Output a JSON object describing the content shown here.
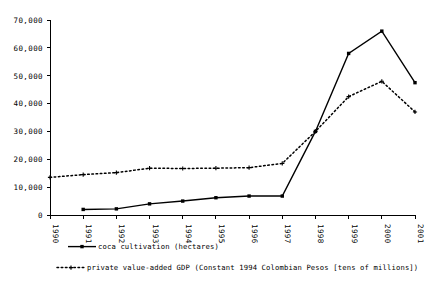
{
  "chart_data": {
    "type": "line",
    "title": "",
    "subtitle": "",
    "xlabel": "",
    "ylabel": "",
    "xlim": [
      1990,
      2001
    ],
    "ylim": [
      0,
      70000
    ],
    "grid": false,
    "legend_position": "bottom-left",
    "categories": [
      1990,
      1991,
      1992,
      1993,
      1994,
      1995,
      1996,
      1997,
      1998,
      1999,
      2000,
      2001
    ],
    "x_tick_labels": [
      "1990",
      "1991",
      "1992",
      "1993",
      "1994",
      "1995",
      "1996",
      "1997",
      "1998",
      "1999",
      "2000",
      "2001"
    ],
    "y_tick_labels": [
      "0",
      "10,000",
      "20,000",
      "30,000",
      "40,000",
      "50,000",
      "60,000",
      "70,000"
    ],
    "y_tick_values": [
      0,
      10000,
      20000,
      30000,
      40000,
      50000,
      60000,
      70000
    ],
    "series": [
      {
        "name": "coca cultivation (hectares)",
        "style": "solid",
        "marker": "square",
        "x": [
          1991,
          1992,
          1993,
          1994,
          1995,
          1996,
          1997,
          1998,
          1999,
          2000,
          2001
        ],
        "values": [
          2000,
          2200,
          4000,
          5000,
          6200,
          6800,
          6800,
          30000,
          58000,
          66000,
          47500
        ]
      },
      {
        "name": "private value-added GDP (Constant 1994 Colombian Pesos [tens of millions])",
        "style": "dotted",
        "marker": "cross",
        "x": [
          1990,
          1991,
          1992,
          1993,
          1994,
          1995,
          1996,
          1997,
          1998,
          1999,
          2000,
          2001
        ],
        "values": [
          13500,
          14500,
          15200,
          16800,
          16700,
          16800,
          17000,
          18500,
          30000,
          42500,
          48000,
          37000
        ]
      }
    ]
  },
  "legend": {
    "entries": [
      {
        "label": "coca cultivation (hectares)",
        "style": "solid-with-marker"
      },
      {
        "label": "private value-added GDP (Constant 1994 Colombian Pesos [tens of millions])",
        "style": "dotted-with-marker"
      }
    ]
  },
  "colors": {
    "axis": "#000000",
    "series_coca": "#000000",
    "series_gdp": "#000000",
    "background": "#ffffff"
  }
}
